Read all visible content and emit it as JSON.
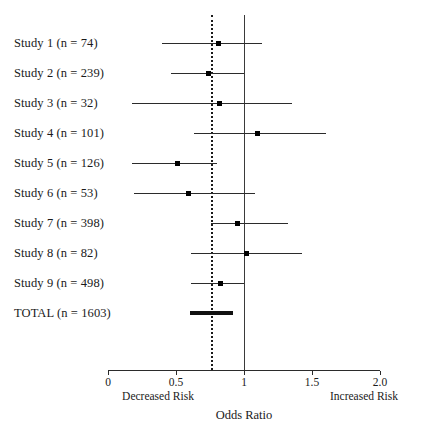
{
  "chart_data": {
    "type": "bar",
    "subtype": "forest-plot",
    "title": "",
    "xlabel": "Odds Ratio",
    "ylabel": "",
    "xlim": [
      0,
      2.0
    ],
    "grid": false,
    "legend": null,
    "x_ticks": [
      "0",
      "0.5",
      "1",
      "1.5",
      "2.0"
    ],
    "x_tick_values": [
      0,
      0.5,
      1,
      1.5,
      2.0
    ],
    "annotations": {
      "left": "Decreased Risk",
      "right": "Increased Risk"
    },
    "reference_lines": [
      {
        "name": "null-effect",
        "value": 1.0,
        "style": "solid"
      },
      {
        "name": "pooled-estimate",
        "value": 0.76,
        "style": "dotted"
      }
    ],
    "categories": [
      "Study 1 (n = 74)",
      "Study 2 (n = 239)",
      "Study 3 (n = 32)",
      "Study 4 (n = 101)",
      "Study 5 (n = 126)",
      "Study 6 (n = 53)",
      "Study 7 (n = 398)",
      "Study 8 (n = 82)",
      "Study 9 (n = 498)",
      "TOTAL (n = 1603)"
    ],
    "values": [
      0.81,
      0.74,
      0.82,
      1.1,
      0.51,
      0.59,
      0.95,
      1.02,
      0.83,
      0.76
    ],
    "ci_low": [
      0.4,
      0.46,
      0.18,
      0.63,
      0.18,
      0.19,
      0.76,
      0.61,
      0.61,
      0.6
    ],
    "ci_high": [
      1.13,
      1.0,
      1.35,
      1.6,
      0.8,
      1.08,
      1.32,
      1.43,
      1.0,
      0.92
    ],
    "rows": [
      {
        "label": "Study 1 (n = 74)",
        "n": 74,
        "or": 0.81,
        "low": 0.4,
        "high": 1.13,
        "summary": false
      },
      {
        "label": "Study 2 (n = 239)",
        "n": 239,
        "or": 0.74,
        "low": 0.46,
        "high": 1.0,
        "summary": false
      },
      {
        "label": "Study 3 (n = 32)",
        "n": 32,
        "or": 0.82,
        "low": 0.18,
        "high": 1.35,
        "summary": false
      },
      {
        "label": "Study 4 (n = 101)",
        "n": 101,
        "or": 1.1,
        "low": 0.63,
        "high": 1.6,
        "summary": false
      },
      {
        "label": "Study 5 (n = 126)",
        "n": 126,
        "or": 0.51,
        "low": 0.18,
        "high": 0.8,
        "summary": false
      },
      {
        "label": "Study 6 (n = 53)",
        "n": 53,
        "or": 0.59,
        "low": 0.19,
        "high": 1.08,
        "summary": false
      },
      {
        "label": "Study 7 (n = 398)",
        "n": 398,
        "or": 0.95,
        "low": 0.76,
        "high": 1.32,
        "summary": false
      },
      {
        "label": "Study 8 (n = 82)",
        "n": 82,
        "or": 1.02,
        "low": 0.61,
        "high": 1.43,
        "summary": false
      },
      {
        "label": "Study 9 (n = 498)",
        "n": 498,
        "or": 0.83,
        "low": 0.61,
        "high": 1.0,
        "summary": false
      },
      {
        "label": "TOTAL (n = 1603)",
        "n": 1603,
        "or": 0.76,
        "low": 0.6,
        "high": 0.92,
        "summary": true
      }
    ],
    "colors": {
      "line": "#2b2b2b",
      "marker": "#000000",
      "reference_solid": "#3a3a3a",
      "reference_dotted": "#1a1a1a",
      "background": "#ffffff",
      "text": "#1a1a1a"
    }
  },
  "layout": {
    "plot_left_px": 108,
    "plot_px_per_unit": 136,
    "row_y_start": 43,
    "row_y_step": 30,
    "axis_y": 370,
    "vline_top": 15,
    "vline_bottom": 370
  }
}
